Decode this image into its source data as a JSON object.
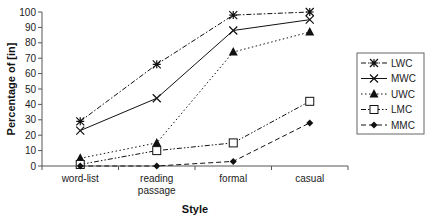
{
  "chart_data": {
    "type": "line",
    "title": "",
    "xlabel": "Style",
    "ylabel": "Percentage of [in]",
    "categories": [
      "word-list",
      "reading passage",
      "formal",
      "casual"
    ],
    "category_lines": [
      [
        "word-list"
      ],
      [
        "reading",
        "passage"
      ],
      [
        "formal"
      ],
      [
        "casual"
      ]
    ],
    "ylim": [
      0,
      100
    ],
    "yticks": [
      0,
      10,
      20,
      30,
      40,
      50,
      60,
      70,
      80,
      90,
      100
    ],
    "grid": false,
    "legend_position": "right",
    "series": [
      {
        "name": "LWC",
        "values": [
          29,
          66,
          98,
          100
        ],
        "line_style": "dash-dot",
        "marker": "asterisk"
      },
      {
        "name": "MWC",
        "values": [
          23,
          44,
          88,
          95
        ],
        "line_style": "solid",
        "marker": "x"
      },
      {
        "name": "UWC",
        "values": [
          5,
          15,
          74,
          87
        ],
        "line_style": "dotted",
        "marker": "triangle-filled"
      },
      {
        "name": "LMC",
        "values": [
          1,
          10,
          15,
          42
        ],
        "line_style": "dash-dot-dot",
        "marker": "square-open"
      },
      {
        "name": "MMC",
        "values": [
          0,
          0,
          3,
          28
        ],
        "line_style": "dashed",
        "marker": "diamond-filled"
      }
    ]
  },
  "colors": {
    "line": "#111111",
    "axis": "#555555",
    "background": "#ffffff"
  }
}
